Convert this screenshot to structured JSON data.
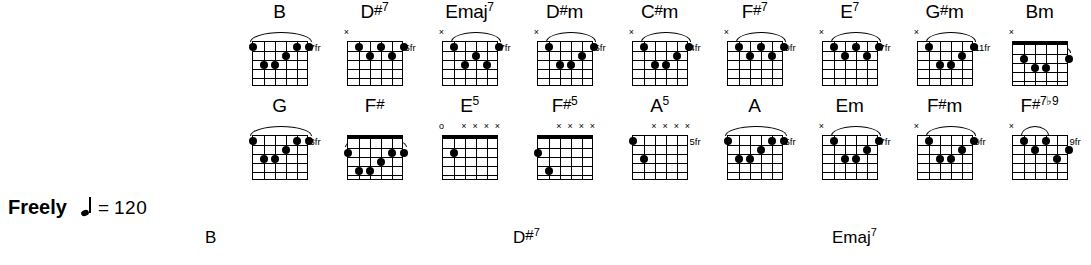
{
  "document": {
    "type": "guitar-chord-chart",
    "tempo": {
      "expression": "Freely",
      "note_icon": "quarter-note-icon",
      "equals": "=",
      "bpm": "120"
    }
  },
  "chord_rows": [
    {
      "row": 1,
      "chords": [
        {
          "name": "B",
          "root": "B",
          "accidental": "",
          "quality": "",
          "superscript": "",
          "fret_label": "7fr",
          "nut": false,
          "barre": {
            "from": 6,
            "to": 1
          },
          "markers": [],
          "dots": [
            {
              "string": 6,
              "fret": 1
            },
            {
              "string": 2,
              "fret": 1
            },
            {
              "string": 1,
              "fret": 1
            },
            {
              "string": 3,
              "fret": 2
            },
            {
              "string": 5,
              "fret": 3
            },
            {
              "string": 4,
              "fret": 3
            }
          ]
        },
        {
          "name": "D#7",
          "root": "D",
          "accidental": "#",
          "quality": "",
          "superscript": "7",
          "fret_label": "6fr",
          "nut": false,
          "barre": null,
          "markers": [
            {
              "string": 6,
              "symbol": "×"
            }
          ],
          "dots": [
            {
              "string": 5,
              "fret": 1
            },
            {
              "string": 3,
              "fret": 1
            },
            {
              "string": 1,
              "fret": 1
            },
            {
              "string": 4,
              "fret": 2
            },
            {
              "string": 2,
              "fret": 2
            }
          ]
        },
        {
          "name": "Emaj7",
          "root": "E",
          "accidental": "",
          "quality": "maj",
          "superscript": "7",
          "fret_label": "7fr",
          "nut": false,
          "barre": {
            "from": 5,
            "to": 1
          },
          "markers": [
            {
              "string": 6,
              "symbol": "×"
            }
          ],
          "dots": [
            {
              "string": 5,
              "fret": 1
            },
            {
              "string": 1,
              "fret": 1
            },
            {
              "string": 3,
              "fret": 2
            },
            {
              "string": 4,
              "fret": 3
            },
            {
              "string": 2,
              "fret": 3
            }
          ]
        },
        {
          "name": "D#m",
          "root": "D",
          "accidental": "#",
          "quality": "m",
          "superscript": "",
          "fret_label": "6fr",
          "nut": false,
          "barre": {
            "from": 5,
            "to": 1
          },
          "markers": [
            {
              "string": 6,
              "symbol": "×"
            }
          ],
          "dots": [
            {
              "string": 5,
              "fret": 1
            },
            {
              "string": 1,
              "fret": 1
            },
            {
              "string": 2,
              "fret": 2
            },
            {
              "string": 4,
              "fret": 3
            },
            {
              "string": 3,
              "fret": 3
            }
          ]
        },
        {
          "name": "C#m",
          "root": "C",
          "accidental": "#",
          "quality": "m",
          "superscript": "",
          "fret_label": "4fr",
          "nut": false,
          "barre": {
            "from": 5,
            "to": 1
          },
          "markers": [
            {
              "string": 6,
              "symbol": "×"
            }
          ],
          "dots": [
            {
              "string": 5,
              "fret": 1
            },
            {
              "string": 1,
              "fret": 1
            },
            {
              "string": 2,
              "fret": 2
            },
            {
              "string": 4,
              "fret": 3
            },
            {
              "string": 3,
              "fret": 3
            }
          ]
        },
        {
          "name": "F#7",
          "root": "F",
          "accidental": "#",
          "quality": "",
          "superscript": "7",
          "fret_label": "9fr",
          "nut": false,
          "barre": {
            "from": 5,
            "to": 1
          },
          "markers": [
            {
              "string": 6,
              "symbol": "×"
            }
          ],
          "dots": [
            {
              "string": 5,
              "fret": 1
            },
            {
              "string": 3,
              "fret": 1
            },
            {
              "string": 1,
              "fret": 1
            },
            {
              "string": 4,
              "fret": 2
            },
            {
              "string": 2,
              "fret": 2
            }
          ]
        },
        {
          "name": "E7",
          "root": "E",
          "accidental": "",
          "quality": "",
          "superscript": "7",
          "fret_label": "7fr",
          "nut": false,
          "barre": {
            "from": 5,
            "to": 1
          },
          "markers": [
            {
              "string": 6,
              "symbol": "×"
            }
          ],
          "dots": [
            {
              "string": 5,
              "fret": 1
            },
            {
              "string": 3,
              "fret": 1
            },
            {
              "string": 1,
              "fret": 1
            },
            {
              "string": 4,
              "fret": 2
            },
            {
              "string": 2,
              "fret": 2
            }
          ]
        },
        {
          "name": "G#m",
          "root": "G",
          "accidental": "#",
          "quality": "m",
          "superscript": "",
          "fret_label": "11fr",
          "nut": false,
          "barre": {
            "from": 5,
            "to": 1
          },
          "markers": [
            {
              "string": 6,
              "symbol": "×"
            }
          ],
          "dots": [
            {
              "string": 5,
              "fret": 1
            },
            {
              "string": 1,
              "fret": 1
            },
            {
              "string": 2,
              "fret": 2
            },
            {
              "string": 4,
              "fret": 3
            },
            {
              "string": 3,
              "fret": 3
            }
          ]
        },
        {
          "name": "Bm",
          "root": "B",
          "accidental": "",
          "quality": "m",
          "superscript": "",
          "fret_label": "",
          "nut": true,
          "barre": {
            "from": 5,
            "to": 1
          },
          "markers": [
            {
              "string": 6,
              "symbol": "×"
            }
          ],
          "dots": [
            {
              "string": 5,
              "fret": 2
            },
            {
              "string": 1,
              "fret": 2
            },
            {
              "string": 4,
              "fret": 3
            },
            {
              "string": 3,
              "fret": 3
            }
          ]
        }
      ]
    },
    {
      "row": 2,
      "chords": [
        {
          "name": "G",
          "root": "G",
          "accidental": "",
          "quality": "",
          "superscript": "",
          "fret_label": "3fr",
          "nut": false,
          "barre": {
            "from": 6,
            "to": 1
          },
          "markers": [],
          "dots": [
            {
              "string": 6,
              "fret": 1
            },
            {
              "string": 2,
              "fret": 1
            },
            {
              "string": 1,
              "fret": 1
            },
            {
              "string": 3,
              "fret": 2
            },
            {
              "string": 5,
              "fret": 3
            },
            {
              "string": 4,
              "fret": 3
            }
          ]
        },
        {
          "name": "F#",
          "root": "F",
          "accidental": "#",
          "quality": "",
          "superscript": "",
          "fret_label": "",
          "nut": true,
          "barre": {
            "from": 6,
            "to": 1
          },
          "markers": [],
          "dots": [
            {
              "string": 6,
              "fret": 2
            },
            {
              "string": 2,
              "fret": 2
            },
            {
              "string": 1,
              "fret": 2
            },
            {
              "string": 3,
              "fret": 3
            },
            {
              "string": 5,
              "fret": 4
            },
            {
              "string": 4,
              "fret": 4
            }
          ]
        },
        {
          "name": "E5",
          "root": "E",
          "accidental": "",
          "quality": "",
          "superscript": "5",
          "fret_label": "",
          "nut": true,
          "barre": null,
          "markers": [
            {
              "string": 6,
              "symbol": "o"
            },
            {
              "string": 4,
              "symbol": "×"
            },
            {
              "string": 3,
              "symbol": "×"
            },
            {
              "string": 2,
              "symbol": "×"
            },
            {
              "string": 1,
              "symbol": "×"
            }
          ],
          "dots": [
            {
              "string": 5,
              "fret": 2
            }
          ]
        },
        {
          "name": "F#5",
          "root": "F",
          "accidental": "#",
          "quality": "",
          "superscript": "5",
          "fret_label": "",
          "nut": true,
          "barre": null,
          "markers": [
            {
              "string": 4,
              "symbol": "×"
            },
            {
              "string": 3,
              "symbol": "×"
            },
            {
              "string": 2,
              "symbol": "×"
            },
            {
              "string": 1,
              "symbol": "×"
            }
          ],
          "dots": [
            {
              "string": 6,
              "fret": 2
            },
            {
              "string": 5,
              "fret": 4
            }
          ]
        },
        {
          "name": "A5",
          "root": "A",
          "accidental": "",
          "quality": "",
          "superscript": "5",
          "fret_label": "5fr",
          "nut": false,
          "barre": null,
          "markers": [
            {
              "string": 4,
              "symbol": "×"
            },
            {
              "string": 3,
              "symbol": "×"
            },
            {
              "string": 2,
              "symbol": "×"
            },
            {
              "string": 1,
              "symbol": "×"
            }
          ],
          "dots": [
            {
              "string": 6,
              "fret": 1
            },
            {
              "string": 5,
              "fret": 3
            }
          ]
        },
        {
          "name": "A",
          "root": "A",
          "accidental": "",
          "quality": "",
          "superscript": "",
          "fret_label": "5fr",
          "nut": false,
          "barre": {
            "from": 6,
            "to": 1
          },
          "markers": [],
          "dots": [
            {
              "string": 6,
              "fret": 1
            },
            {
              "string": 2,
              "fret": 1
            },
            {
              "string": 1,
              "fret": 1
            },
            {
              "string": 3,
              "fret": 2
            },
            {
              "string": 5,
              "fret": 3
            },
            {
              "string": 4,
              "fret": 3
            }
          ]
        },
        {
          "name": "Em",
          "root": "E",
          "accidental": "",
          "quality": "m",
          "superscript": "",
          "fret_label": "7fr",
          "nut": false,
          "barre": {
            "from": 5,
            "to": 1
          },
          "markers": [
            {
              "string": 6,
              "symbol": "×"
            }
          ],
          "dots": [
            {
              "string": 5,
              "fret": 1
            },
            {
              "string": 1,
              "fret": 1
            },
            {
              "string": 2,
              "fret": 2
            },
            {
              "string": 4,
              "fret": 3
            },
            {
              "string": 3,
              "fret": 3
            }
          ]
        },
        {
          "name": "F#m",
          "root": "F",
          "accidental": "#",
          "quality": "m",
          "superscript": "",
          "fret_label": "9fr",
          "nut": false,
          "barre": {
            "from": 5,
            "to": 1
          },
          "markers": [
            {
              "string": 6,
              "symbol": "×"
            }
          ],
          "dots": [
            {
              "string": 5,
              "fret": 1
            },
            {
              "string": 1,
              "fret": 1
            },
            {
              "string": 2,
              "fret": 2
            },
            {
              "string": 4,
              "fret": 3
            },
            {
              "string": 3,
              "fret": 3
            }
          ]
        },
        {
          "name": "F#7b9",
          "root": "F",
          "accidental": "#",
          "quality": "",
          "superscript": "7♭9",
          "fret_label": "9fr",
          "nut": false,
          "barre": {
            "from": 5,
            "to": 3
          },
          "markers": [
            {
              "string": 6,
              "symbol": "×"
            }
          ],
          "dots": [
            {
              "string": 5,
              "fret": 1
            },
            {
              "string": 3,
              "fret": 1
            },
            {
              "string": 1,
              "fret": 2
            },
            {
              "string": 4,
              "fret": 2
            },
            {
              "string": 2,
              "fret": 3
            }
          ]
        }
      ]
    }
  ],
  "staff_chord_labels": [
    {
      "root": "B",
      "accidental": "",
      "superscript": "",
      "left": 205
    },
    {
      "root": "D",
      "accidental": "#",
      "superscript": "7",
      "left": 513
    },
    {
      "root": "E",
      "accidental": "",
      "superscript": "7",
      "quality": "maj",
      "left": 832
    }
  ]
}
